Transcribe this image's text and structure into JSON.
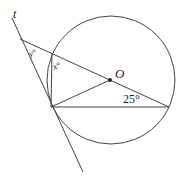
{
  "diagram": {
    "type": "geometry",
    "labels": {
      "tangent_line": "t",
      "center": "O",
      "angle_y": "y°",
      "angle_x": "x°",
      "angle_given": "25°"
    },
    "colors": {
      "stroke": "#333333",
      "background": "#ffffff"
    }
  }
}
